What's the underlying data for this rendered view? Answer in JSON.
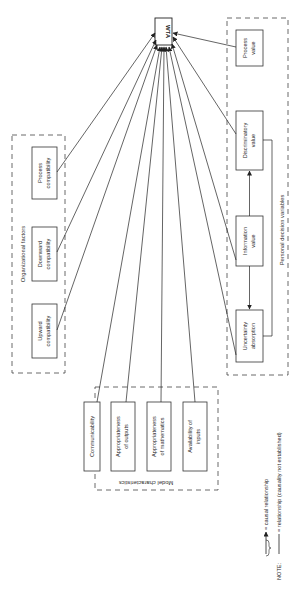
{
  "diagram": {
    "target": {
      "label": "WTA"
    },
    "groups": {
      "organizational": {
        "title": "Organizational factors",
        "items": [
          {
            "line1": "Process",
            "line2": "compatibility"
          },
          {
            "line1": "Downward",
            "line2": "compatibility"
          },
          {
            "line1": "Upward",
            "line2": "compatibility"
          }
        ]
      },
      "model": {
        "title": "Model characteristics",
        "items": [
          {
            "line1": "Communicability",
            "line2": ""
          },
          {
            "line1": "Appropriateness",
            "line2": "of outputs"
          },
          {
            "line1": "Appropriateness",
            "line2": "of mathematics"
          },
          {
            "line1": "Availability of",
            "line2": "inputs"
          }
        ]
      },
      "personal": {
        "title": "Personal decision variables",
        "items": [
          {
            "line1": "Process",
            "line2": "value"
          },
          {
            "line1": "Discriminatory",
            "line2": "value"
          },
          {
            "line1": "Information",
            "line2": "value"
          },
          {
            "line1": "Uncertainty",
            "line2": "absorption"
          }
        ]
      }
    },
    "note": {
      "label": "NOTE:",
      "causal": "= causal relationship",
      "relationship": "= relationship (causality not established)"
    }
  }
}
